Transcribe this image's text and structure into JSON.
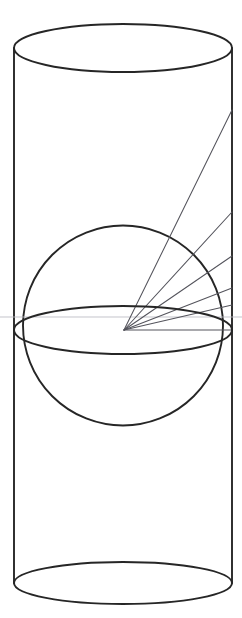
{
  "figure": {
    "background_color": "#ffffff",
    "stroke_color": "#262626",
    "ray_color": "#54545c",
    "faint_ray_color": "#b9b9c2",
    "canvas": {
      "width": 242,
      "height": 618
    },
    "cylinder": {
      "name": "cylinder",
      "left_x": 14,
      "right_x": 232,
      "radius_x": 109,
      "center_x": 123,
      "top_ellipse": {
        "cy": 48,
        "rx": 109,
        "ry": 24
      },
      "bottom_ellipse": {
        "cy": 583,
        "rx": 109,
        "ry": 21
      },
      "side_top_y": 48,
      "side_bottom_y": 583
    },
    "sphere": {
      "name": "sphere",
      "cx": 123,
      "cy": 325.5,
      "r": 100,
      "top_y": 226,
      "bottom_y": 425
    },
    "equator": {
      "name": "equator-ellipse",
      "cx": 123,
      "cy": 330,
      "rx": 109,
      "ry": 24
    },
    "ray_origin": {
      "x": 124,
      "y": 330
    },
    "rays": [
      {
        "name": "ray-1",
        "end_x": 232,
        "end_y": 110
      },
      {
        "name": "ray-2",
        "end_x": 232,
        "end_y": 212
      },
      {
        "name": "ray-3",
        "end_x": 232,
        "end_y": 256
      },
      {
        "name": "ray-4",
        "end_x": 232,
        "end_y": 288
      },
      {
        "name": "ray-5",
        "end_x": 232,
        "end_y": 305
      },
      {
        "name": "ray-6",
        "end_x": 232,
        "end_y": 330
      }
    ],
    "faint_guide": {
      "name": "horizontal-guide",
      "x1": 0,
      "y1": 317,
      "x2": 242,
      "y2": 317
    }
  }
}
